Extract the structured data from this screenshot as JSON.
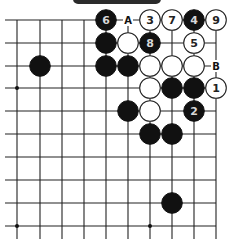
{
  "diagram": {
    "type": "go-board-fragment",
    "banner": {
      "visible": true,
      "color": "#2b2b2b"
    },
    "grid": {
      "columns_x": [
        17,
        40,
        62,
        84,
        106,
        128,
        150,
        172,
        194,
        216
      ],
      "rows_y": [
        20,
        43,
        66,
        88,
        111,
        134,
        157,
        180,
        203,
        226
      ],
      "left_extend_to": 5,
      "bottom_extend_to": 239,
      "top_edge_row": 0,
      "right_edge_col": 9
    },
    "star_points": [
      {
        "col": 0,
        "row": 3
      },
      {
        "col": 0,
        "row": 9
      },
      {
        "col": 6,
        "row": 9
      }
    ],
    "stones": [
      {
        "col": 4,
        "row": 0,
        "color": "black",
        "label": "6"
      },
      {
        "col": 6,
        "row": 0,
        "color": "white",
        "label": "3"
      },
      {
        "col": 7,
        "row": 0,
        "color": "white",
        "label": "7"
      },
      {
        "col": 8,
        "row": 0,
        "color": "black",
        "label": "4"
      },
      {
        "col": 9,
        "row": 0,
        "color": "white",
        "label": "9"
      },
      {
        "col": 4,
        "row": 1,
        "color": "black",
        "label": ""
      },
      {
        "col": 5,
        "row": 1,
        "color": "white",
        "label": ""
      },
      {
        "col": 6,
        "row": 1,
        "color": "black",
        "label": "8"
      },
      {
        "col": 8,
        "row": 1,
        "color": "white",
        "label": "5"
      },
      {
        "col": 1,
        "row": 2,
        "color": "black",
        "label": ""
      },
      {
        "col": 4,
        "row": 2,
        "color": "black",
        "label": ""
      },
      {
        "col": 5,
        "row": 2,
        "color": "black",
        "label": ""
      },
      {
        "col": 6,
        "row": 2,
        "color": "white",
        "label": ""
      },
      {
        "col": 7,
        "row": 2,
        "color": "white",
        "label": ""
      },
      {
        "col": 8,
        "row": 2,
        "color": "white",
        "label": ""
      },
      {
        "col": 6,
        "row": 3,
        "color": "white",
        "label": ""
      },
      {
        "col": 7,
        "row": 3,
        "color": "black",
        "label": ""
      },
      {
        "col": 8,
        "row": 3,
        "color": "black",
        "label": ""
      },
      {
        "col": 9,
        "row": 3,
        "color": "white",
        "label": "1"
      },
      {
        "col": 5,
        "row": 4,
        "color": "black",
        "label": ""
      },
      {
        "col": 6,
        "row": 4,
        "color": "white",
        "label": ""
      },
      {
        "col": 8,
        "row": 4,
        "color": "black",
        "label": "2"
      },
      {
        "col": 6,
        "row": 5,
        "color": "black",
        "label": ""
      },
      {
        "col": 7,
        "row": 5,
        "color": "black",
        "label": ""
      },
      {
        "col": 7,
        "row": 8,
        "color": "black",
        "label": ""
      }
    ],
    "point_labels": [
      {
        "col": 5,
        "row": 0,
        "text": "A"
      },
      {
        "col": 9,
        "row": 2,
        "text": "B"
      }
    ]
  }
}
